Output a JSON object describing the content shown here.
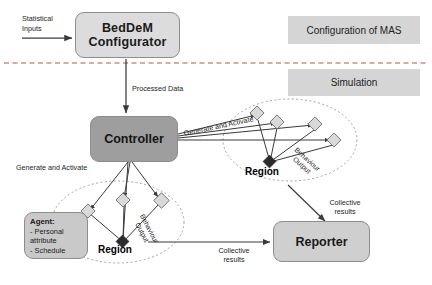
{
  "diagram": {
    "title_hidden": "",
    "phases": [
      {
        "id": "configuration",
        "label": "Configuration of MAS"
      },
      {
        "id": "simulation",
        "label": "Simulation"
      }
    ],
    "nodes": {
      "configurator": "BedDeM\nConfigurator",
      "configurator_line1": "BedDeM",
      "configurator_line2": "Configurator",
      "controller": "Controller",
      "reporter": "Reporter",
      "region_left": "Region",
      "region_right": "Region",
      "agent_title": "Agent:",
      "agent_item1": "- Personal",
      "agent_item2": "attribute",
      "agent_item3": "- Schedule"
    },
    "edge_labels": {
      "statistical_inputs_line1": "Statistical",
      "statistical_inputs_line2": "Inputs",
      "processed_data": "Processed Data",
      "generate_activate_right": "Generate and Activate",
      "generate_activate_left": "Generate and Activate",
      "behaviour_output_right_line1": "Behaviour",
      "behaviour_output_right_line2": "Output",
      "behaviour_output_left_line1": "Behaviour",
      "behaviour_output_left_line2": "Output",
      "collective_results_right_line1": "Collective",
      "collective_results_right_line2": "results",
      "collective_results_left_line1": "Collective",
      "collective_results_left_line2": "results"
    },
    "colors": {
      "configurator_fill": "#dcdcdc",
      "controller_fill": "#9e9e9e",
      "reporter_fill": "#cfcfcf",
      "agent_fill": "#c9c9c9",
      "phase_fill": "#d5d5d5",
      "stroke": "#8d8d8d",
      "line": "#3a3a3a",
      "agent_node_fill": "#d9d9d9",
      "hub_node_fill": "#2b2b2b",
      "divider": "#b05a3c",
      "background": "#ffffff"
    }
  }
}
